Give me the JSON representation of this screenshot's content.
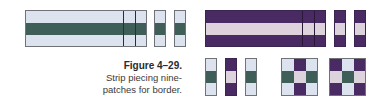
{
  "colors": {
    "light": "#dce3ee",
    "green": "#3f5e57",
    "purple": "#4a2a62",
    "pink_light": "#ddd3dc",
    "border": "#6f7378"
  },
  "figure": {
    "label": "Figure 4–29.",
    "caption_lines": [
      "Strip piecing nine-",
      "patches for border."
    ]
  },
  "strip_sets": [
    {
      "name": "light-green-light",
      "rows": [
        "light",
        "green",
        "light"
      ]
    },
    {
      "name": "purple-light-purple",
      "rows": [
        "purple",
        "pink_light",
        "purple"
      ]
    }
  ],
  "units": [
    {
      "name": "unit-a",
      "cells": [
        "light",
        "green",
        "light"
      ]
    },
    {
      "name": "unit-b",
      "cells": [
        "purple",
        "pink_light",
        "purple"
      ]
    },
    {
      "name": "unit-c",
      "cells": [
        "light",
        "green",
        "light"
      ]
    }
  ],
  "nine_patches": [
    {
      "name": "nine-patch-1",
      "grid": [
        [
          "light",
          "purple",
          "light"
        ],
        [
          "green",
          "pink_light",
          "green"
        ],
        [
          "light",
          "purple",
          "light"
        ]
      ]
    },
    {
      "name": "nine-patch-2",
      "grid": [
        [
          "purple",
          "light",
          "purple"
        ],
        [
          "pink_light",
          "green",
          "pink_light"
        ],
        [
          "purple",
          "light",
          "purple"
        ]
      ]
    }
  ]
}
